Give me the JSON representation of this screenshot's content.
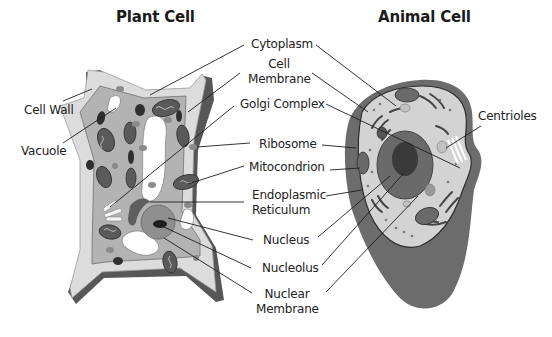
{
  "titles": {
    "plant": "Plant Cell",
    "animal": "Animal Cell"
  },
  "labels": {
    "cell_wall": "Cell Wall",
    "vacuole": "Vacuole",
    "cytoplasm": "Cytoplasm",
    "cell_membrane_1": "Cell",
    "cell_membrane_2": "Membrane",
    "golgi_complex": "Golgi Complex",
    "ribosome": "Ribosome",
    "mitocondrion": "Mitocondrion",
    "endoplasmic_1": "Endoplasmic",
    "endoplasmic_2": "Reticulum",
    "nucleus": "Nucleus",
    "nucleolus": "Nucleolus",
    "nuclear_membrane_1": "Nuclear",
    "nuclear_membrane_2": "Membrane",
    "centrioles": "Centrioles"
  },
  "colors": {
    "background": "#ffffff",
    "cell_wall_dark": "#5a5a5a",
    "cell_wall_light": "#d9d9d9",
    "cytoplasm_plant": "#b5b5b5",
    "cytoplasm_animal": "#d4d4d4",
    "animal_outer": "#6a6a6a",
    "organelle_dark": "#3a3a3a",
    "text": "#222222"
  }
}
